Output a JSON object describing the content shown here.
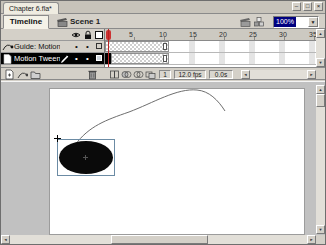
{
  "window": {
    "tab_title": "Chapter 6.fla*",
    "minimize_glyph": "–",
    "restore_glyph": "□",
    "close_glyph": "×"
  },
  "timeline": {
    "tab_label": "Timeline",
    "scene_name": "Scene 1",
    "zoom_value": "100%",
    "ruler_numbers": [
      "1",
      "5",
      "10",
      "15",
      "20",
      "25",
      "30",
      "35"
    ],
    "layers": [
      {
        "name": "Guide: Motion ...",
        "type": "motion-guide-layer",
        "selected": false
      },
      {
        "name": "Motion Tween",
        "type": "tween-layer",
        "selected": true
      }
    ],
    "tween_span_frames": "1-10",
    "status": {
      "current_frame": "1",
      "frame_rate": "12.0 fps",
      "elapsed_time": "0.0s"
    }
  },
  "glyphs": {
    "dot": "•",
    "up_arrow": "▲",
    "down_arrow": "▼",
    "left_arrow": "◄",
    "right_arrow": "►"
  },
  "colors": {
    "chrome": "#d4d0c8",
    "selected_layer": "#000000",
    "playhead": "#bb2222",
    "zoom_highlight": "#000080",
    "workspace": "#c1c1c1",
    "stage": "#ffffff",
    "shape_fill": "#0a0a0a"
  }
}
